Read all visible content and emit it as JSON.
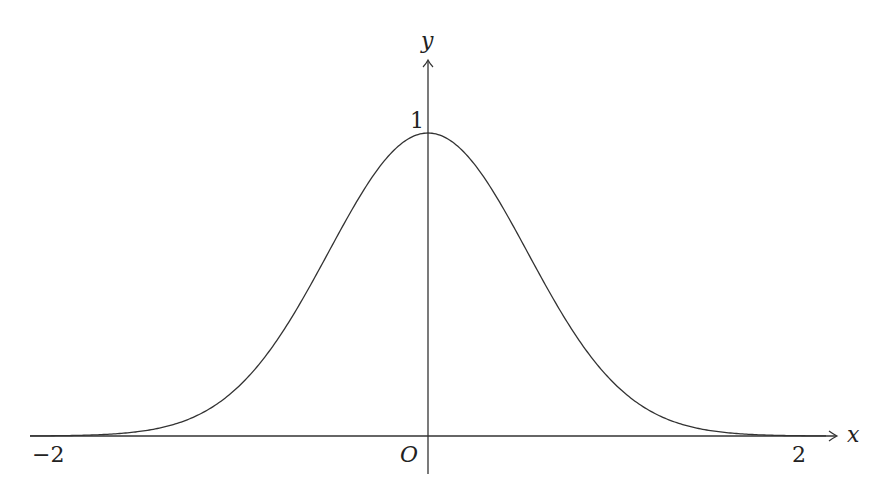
{
  "chart_data": {
    "type": "line",
    "title": "",
    "function": "y = e^(-2x^2)",
    "xlabel": "x",
    "ylabel": "y",
    "xlim": [
      -2,
      2
    ],
    "ylim": [
      0,
      1
    ],
    "grid": false,
    "legend": null,
    "x_tick_labels": [
      "-2",
      "2"
    ],
    "y_tick_labels": [
      "1"
    ],
    "origin_label": "O",
    "series": [
      {
        "name": "curve",
        "x": [
          -2,
          -1.5,
          -1.25,
          -1,
          -0.75,
          -0.5,
          -0.25,
          0,
          0.25,
          0.5,
          0.75,
          1,
          1.25,
          1.5,
          2
        ],
        "values": [
          0.0003,
          0.011,
          0.044,
          0.135,
          0.325,
          0.607,
          0.882,
          1,
          0.882,
          0.607,
          0.325,
          0.135,
          0.044,
          0.011,
          0.0003
        ]
      }
    ],
    "line_color": "#333333"
  },
  "labels": {
    "x_axis": "x",
    "y_axis": "y",
    "origin": "O",
    "tick_neg2": "−2",
    "tick_pos2": "2",
    "tick_y1": "1"
  }
}
